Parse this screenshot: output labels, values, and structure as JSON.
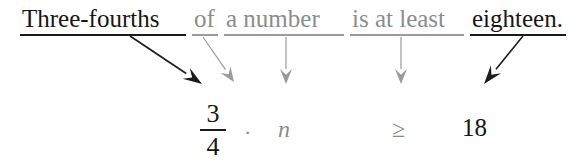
{
  "sentence": {
    "segments": [
      {
        "text": "Three-fourths",
        "tone": "dark",
        "left": 22,
        "underline_left": 20,
        "underline_width": 166,
        "underline_tone": "dark"
      },
      {
        "text": "of",
        "tone": "gray",
        "left": 194,
        "underline_left": 192,
        "underline_width": 26,
        "underline_tone": "gray"
      },
      {
        "text": "a number",
        "tone": "gray",
        "left": 226,
        "underline_left": 224,
        "underline_width": 120,
        "underline_tone": "gray"
      },
      {
        "text": "is at least",
        "tone": "gray",
        "left": 352,
        "underline_left": 350,
        "underline_width": 114,
        "underline_tone": "gray"
      },
      {
        "text": "eighteen.",
        "tone": "dark",
        "left": 472,
        "underline_left": 470,
        "underline_width": 96,
        "underline_tone": "dark"
      }
    ]
  },
  "expression": {
    "fraction": {
      "numerator": "3",
      "denominator": "4",
      "left": 196,
      "top": 100
    },
    "multiplication_dot": {
      "text": "·",
      "left": 244,
      "top": 120
    },
    "variable": {
      "text": "n",
      "left": 278,
      "top": 116
    },
    "relation": {
      "text": "≥",
      "left": 392,
      "top": 116
    },
    "number": {
      "text": "18",
      "left": 462,
      "top": 114
    }
  },
  "arrows": [
    {
      "name": "arrow-three-fourths",
      "tone": "dark",
      "x1": 130,
      "y1": 36,
      "x2": 202,
      "y2": 84
    },
    {
      "name": "arrow-of",
      "tone": "gray",
      "x1": 203,
      "y1": 37,
      "x2": 234,
      "y2": 82
    },
    {
      "name": "arrow-a-number",
      "tone": "gray",
      "x1": 286,
      "y1": 37,
      "x2": 286,
      "y2": 84
    },
    {
      "name": "arrow-is-at-least",
      "tone": "gray",
      "x1": 401,
      "y1": 37,
      "x2": 401,
      "y2": 84
    },
    {
      "name": "arrow-eighteen",
      "tone": "dark",
      "x1": 523,
      "y1": 36,
      "x2": 484,
      "y2": 84
    }
  ],
  "colors": {
    "dark": "#161616",
    "gray": "#8c8c8c",
    "rule_dark": "#1b1b1b",
    "rule_gray": "#9a9a9a",
    "background": "#ffffff"
  }
}
